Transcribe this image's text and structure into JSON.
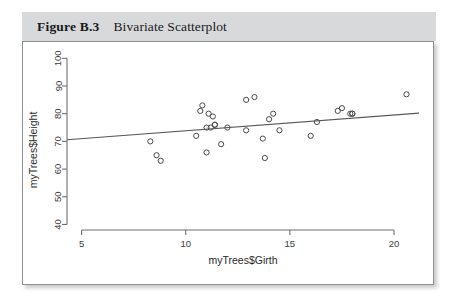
{
  "figure": {
    "number": "Figure B.3",
    "title": "Bivariate Scatterplot"
  },
  "colors": {
    "caption_background": "#d8d9db",
    "panel_background": "#ffffff",
    "panel_border": "#8e8f92",
    "axis": "#6e6f72",
    "point_stroke": "#4a4a4a",
    "line_stroke": "#58585a"
  },
  "chart_data": {
    "type": "scatter",
    "title": "Bivariate Scatterplot",
    "xlabel": "myTrees$Girth",
    "ylabel": "myTrees$Height",
    "xlim": [
      4.3,
      21.2
    ],
    "ylim": [
      38,
      103
    ],
    "xticks": [
      5,
      10,
      15,
      20
    ],
    "yticks": [
      40,
      50,
      60,
      70,
      80,
      90,
      100
    ],
    "grid": false,
    "legend": "none",
    "marker": "open-circle",
    "series": [
      {
        "name": "myTrees",
        "x": [
          8.3,
          8.6,
          8.8,
          10.5,
          10.7,
          10.8,
          11.0,
          11.0,
          11.1,
          11.2,
          11.3,
          11.4,
          11.4,
          11.7,
          12.0,
          12.9,
          12.9,
          13.3,
          13.7,
          13.8,
          14.0,
          14.2,
          14.5,
          16.0,
          16.3,
          17.3,
          17.5,
          17.9,
          18.0,
          18.0,
          20.6
        ],
        "y": [
          70,
          65,
          63,
          72,
          81,
          83,
          66,
          75,
          80,
          75,
          79,
          76,
          76,
          69,
          75,
          74,
          85,
          86,
          71,
          64,
          78,
          80,
          74,
          72,
          77,
          81,
          82,
          80,
          80,
          80,
          87
        ]
      }
    ],
    "fit_line": {
      "type": "linear-regression",
      "x_start": 4.3,
      "y_start": 70.6,
      "x_end": 21.2,
      "y_end": 80.2
    }
  }
}
